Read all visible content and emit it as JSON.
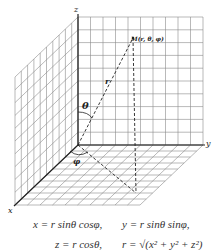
{
  "diagram": {
    "axes": {
      "x": "x",
      "y": "y",
      "z": "z"
    },
    "point_label": "M(r, θ, φ)",
    "radius_label": "r",
    "theta_label": "θ",
    "phi_label": "φ",
    "grid": {
      "back_wall_cells": 10,
      "side_wall_cells": 10,
      "floor_cells": 10
    }
  },
  "formulas": {
    "x": "x = r sinθ cosφ,",
    "y": "y = r sinθ sinφ,",
    "z_partial": "z = r cosθ,",
    "r_partial": "r = √(x² + y² + z²)"
  }
}
